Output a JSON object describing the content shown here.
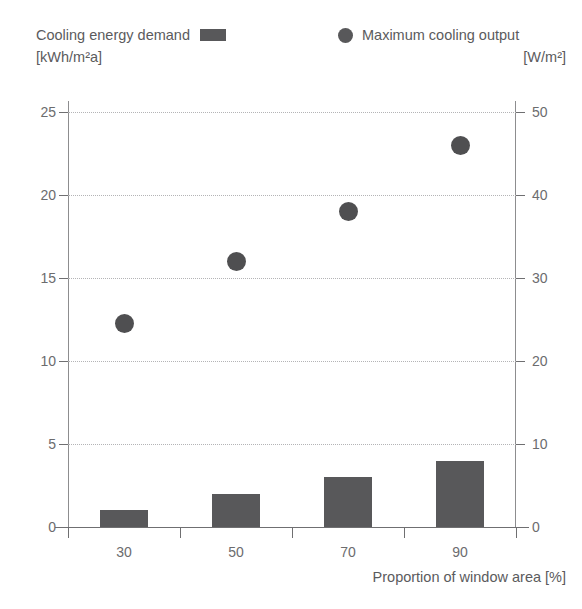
{
  "legend": {
    "bars": {
      "label": "Cooling energy demand",
      "units": "[kWh/m²a]",
      "marker": "bar-swatch",
      "color": "#58585a"
    },
    "dots": {
      "label": "Maximum cooling output",
      "units": "[W/m²]",
      "marker": "circle-swatch",
      "color": "#58585a"
    }
  },
  "axis_title_x": "Proportion of window area [%]",
  "chart_data": {
    "type": "bar",
    "title": "",
    "categories": [
      "30",
      "50",
      "70",
      "90"
    ],
    "xlabel": "Proportion of window area [%]",
    "grid": true,
    "legend_position": "top",
    "series": [
      {
        "name": "Cooling energy demand",
        "type": "bar",
        "axis": "left",
        "unit": "kWh/m²a",
        "color": "#58585a",
        "values": [
          1,
          2,
          3,
          4
        ]
      },
      {
        "name": "Maximum cooling output",
        "type": "scatter",
        "axis": "right",
        "unit": "W/m²",
        "color": "#4f4f51",
        "values": [
          24.5,
          32,
          38,
          46
        ]
      }
    ],
    "axes": {
      "left": {
        "label": "Cooling energy demand [kWh/m²a]",
        "ticks": [
          "0",
          "5",
          "10",
          "15",
          "20",
          "25"
        ],
        "tick_values": [
          0,
          5,
          10,
          15,
          20,
          25
        ],
        "ylim": [
          0,
          25
        ]
      },
      "right": {
        "label": "Maximum cooling output [W/m²]",
        "ticks": [
          "0",
          "10",
          "20",
          "30",
          "40",
          "50"
        ],
        "tick_values": [
          0,
          10,
          20,
          30,
          40,
          50
        ],
        "ylim": [
          0,
          50
        ]
      }
    }
  }
}
